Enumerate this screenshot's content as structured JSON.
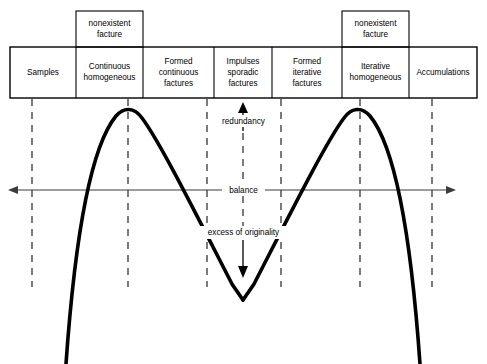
{
  "diagram": {
    "table": {
      "cells": [
        {
          "label": "Samples"
        },
        {
          "label": "Continuous homogeneous"
        },
        {
          "label": "Formed continuous factures"
        },
        {
          "label": "Impulses sporadic factures"
        },
        {
          "label": "Formed iterative factures"
        },
        {
          "label": "Iterative homogeneous"
        },
        {
          "label": "Accumulations"
        }
      ]
    },
    "superboxes": [
      {
        "label": "nonexistent facture"
      },
      {
        "label": "nonexistent facture"
      }
    ],
    "annotations": {
      "redundancy": "redundancy",
      "balance": "balance",
      "excess": "excess of originality"
    },
    "colors": {
      "stroke": "#000000",
      "axis": "#3a3a3a",
      "background": "#ffffff"
    }
  }
}
